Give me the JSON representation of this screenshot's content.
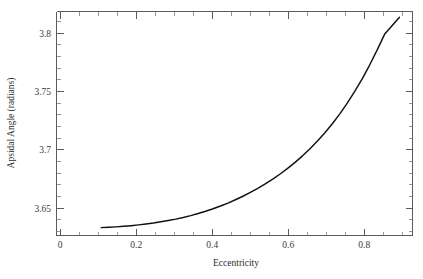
{
  "chart_data": {
    "type": "line",
    "title": "",
    "xlabel": "Eccentricity",
    "ylabel": "Apsidal Angle (radians)",
    "xlim": [
      -0.02,
      0.935
    ],
    "ylim": [
      3.6255,
      3.8305
    ],
    "grid": false,
    "legend": null,
    "x_ticks": [
      0,
      0.2,
      0.4,
      0.6,
      0.8
    ],
    "x_tick_labels": [
      "0",
      "0.2",
      "0.4",
      "0.6",
      "0.8"
    ],
    "x_minor_step": 0.05,
    "y_ticks": [
      3.65,
      3.7,
      3.75,
      3.8
    ],
    "y_tick_labels": [
      "3.65",
      "3.7",
      "3.75",
      "3.8"
    ],
    "y_minor_step": 0.01,
    "series": [
      {
        "name": "apsidal angle",
        "color": "#111111",
        "x": [
          0.1,
          0.12,
          0.14,
          0.16,
          0.18,
          0.2,
          0.22,
          0.24,
          0.26,
          0.28,
          0.3,
          0.32,
          0.34,
          0.36,
          0.38,
          0.4,
          0.42,
          0.44,
          0.46,
          0.48,
          0.5,
          0.52,
          0.54,
          0.56,
          0.58,
          0.6,
          0.62,
          0.64,
          0.66,
          0.68,
          0.7,
          0.72,
          0.74,
          0.76,
          0.78,
          0.8,
          0.82,
          0.84,
          0.86,
          0.88,
          0.9
        ],
        "y": [
          3.6327,
          3.633,
          3.6334,
          3.6339,
          3.6345,
          3.6352,
          3.636,
          3.6369,
          3.638,
          3.6392,
          3.6405,
          3.642,
          3.6437,
          3.6456,
          3.6477,
          3.65,
          3.6525,
          3.6552,
          3.6582,
          3.6614,
          3.6649,
          3.6687,
          3.6727,
          3.6771,
          3.6818,
          3.6869,
          3.6924,
          3.6984,
          3.7049,
          3.7119,
          3.7195,
          3.7278,
          3.7368,
          3.7466,
          3.7573,
          3.7689,
          3.7815,
          3.7951,
          3.8096,
          3.8175,
          3.8252
        ]
      }
    ]
  },
  "axes": {
    "y_label": "Apsidal Angle (radians)",
    "x_label": "Eccentricity"
  },
  "caption": {
    "partial_text": ""
  }
}
